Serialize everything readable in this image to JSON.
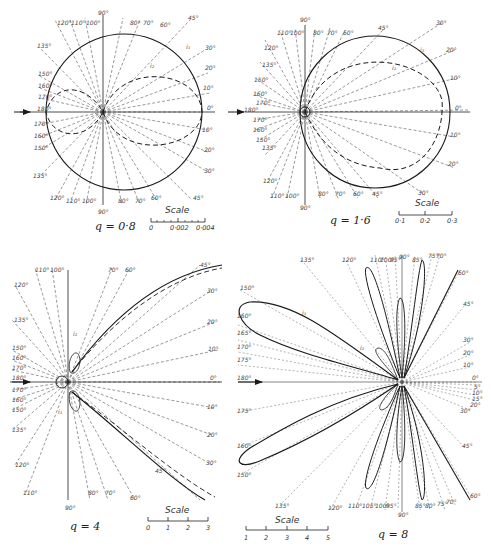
{
  "figure": {
    "panels": [
      {
        "id": "q08",
        "label": "q = 0·8",
        "scale": {
          "title": "Scale",
          "ticks": [
            "0",
            "0·002",
            "0·004"
          ]
        },
        "curves": [
          "i1",
          "i2"
        ],
        "angles_upper": [
          "135°",
          "150°",
          "160°",
          "170°",
          "180°",
          "120°",
          "110°",
          "100°",
          "90°",
          "80°",
          "70°",
          "60°",
          "45°",
          "30°",
          "20°",
          "10°",
          "0°"
        ],
        "angles_lower": [
          "170°",
          "160°",
          "150°",
          "135°",
          "120°",
          "110°",
          "100°",
          "90°",
          "80°",
          "70°",
          "60°",
          "45°",
          "30°",
          "20°",
          "10°"
        ]
      },
      {
        "id": "q16",
        "label": "q = 1·6",
        "scale": {
          "title": "Scale",
          "ticks": [
            "0·1",
            "0·2",
            "0·3"
          ]
        },
        "curves": [
          "i1",
          "i2"
        ],
        "angles_upper": [
          "90°",
          "110°",
          "120°",
          "100°",
          "80°",
          "70°",
          "60°",
          "45°",
          "30°",
          "20°",
          "10°",
          "0°",
          "135°",
          "150°",
          "160°",
          "170°",
          "180°"
        ],
        "angles_lower": [
          "170°",
          "160°",
          "150°",
          "135°",
          "120°",
          "110°",
          "100°",
          "90°",
          "80°",
          "70°",
          "60°",
          "45°",
          "30°",
          "20°",
          "10°"
        ]
      },
      {
        "id": "q4",
        "label": "q = 4",
        "scale": {
          "title": "Scale",
          "ticks": [
            "0",
            "1",
            "2",
            "3"
          ]
        },
        "curves": [
          "i1",
          "i2"
        ],
        "angles_upper": [
          "110°",
          "100°",
          "90°",
          "80°",
          "70°",
          "60°",
          "45°",
          "30°",
          "20°",
          "10°",
          "0°",
          "120°",
          "135°",
          "150°",
          "160°",
          "170°",
          "180°"
        ],
        "angles_lower": [
          "170°",
          "160°",
          "150°",
          "135°",
          "120°",
          "110°",
          "100°",
          "90°",
          "80°",
          "70°",
          "60°",
          "45°",
          "30°",
          "20°",
          "10°"
        ]
      },
      {
        "id": "q8",
        "label": "q = 8",
        "scale": {
          "title": "Scale",
          "ticks": [
            "1",
            "2",
            "3",
            "4",
            "5"
          ]
        },
        "curves": [
          "i1",
          "i2"
        ],
        "angles_upper": [
          "150°",
          "135°",
          "120°",
          "110°",
          "100°",
          "95°",
          "90°",
          "85°",
          "80°",
          "75°",
          "70°",
          "60°",
          "45°",
          "30°",
          "20°",
          "10°",
          "0°",
          "160°",
          "165°",
          "170°",
          "175°",
          "180°"
        ],
        "angles_lower": [
          "5°",
          "10°",
          "15°",
          "20°",
          "30°",
          "45°",
          "60°",
          "70°",
          "75°",
          "80°",
          "85°",
          "90°",
          "95°",
          "100°",
          "110°",
          "120°",
          "135°",
          "150°",
          "160°",
          "170°"
        ]
      }
    ],
    "incident_arrow": "arrow-right",
    "colors": {
      "ink": "#1a1a1a",
      "dashed": "#555555",
      "background": "#ffffff"
    }
  }
}
